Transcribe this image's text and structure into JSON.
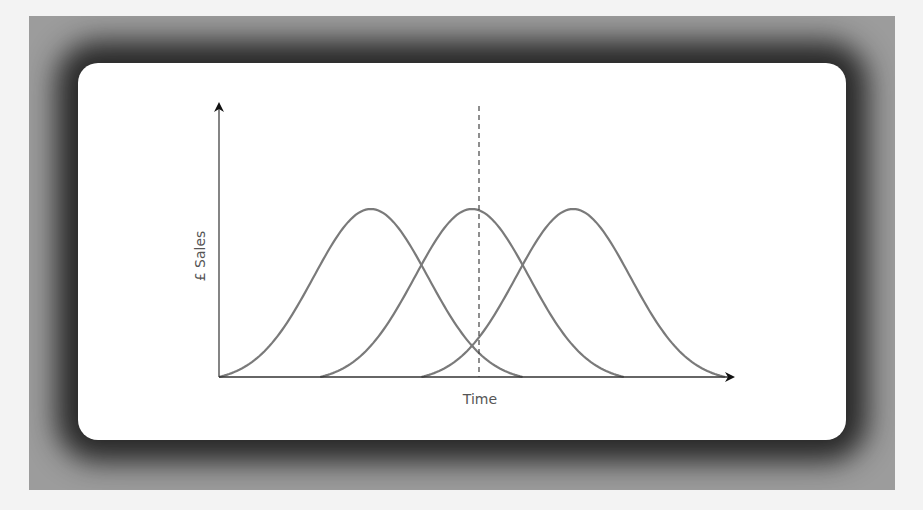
{
  "figure": {
    "title": "",
    "x_axis_label": "Time",
    "y_axis_label": "£ Sales"
  },
  "colors": {
    "curve": "#7a7a7a",
    "axis": "#222222",
    "dashed_line": "#444444",
    "frame": "#9c9c9c",
    "card": "#ffffff"
  },
  "chart_data": {
    "type": "line",
    "title": "",
    "xlabel": "Time",
    "ylabel": "£ Sales",
    "grid": false,
    "legend": null,
    "ticks": false,
    "series": [
      {
        "name": "Product 1",
        "start": 0.0,
        "peak": 0.3,
        "end": 0.6,
        "peak_value": 1.0
      },
      {
        "name": "Product 2",
        "start": 0.2,
        "peak": 0.5,
        "end": 0.8,
        "peak_value": 1.0
      },
      {
        "name": "Product 3",
        "start": 0.4,
        "peak": 0.7,
        "end": 1.0,
        "peak_value": 1.0
      }
    ],
    "annotations": [
      {
        "type": "vertical_dashed_line",
        "x": 0.5,
        "note": "aligned with peak of Product 2"
      }
    ],
    "xlim": [
      0,
      1
    ],
    "ylim": [
      0,
      1.2
    ]
  }
}
